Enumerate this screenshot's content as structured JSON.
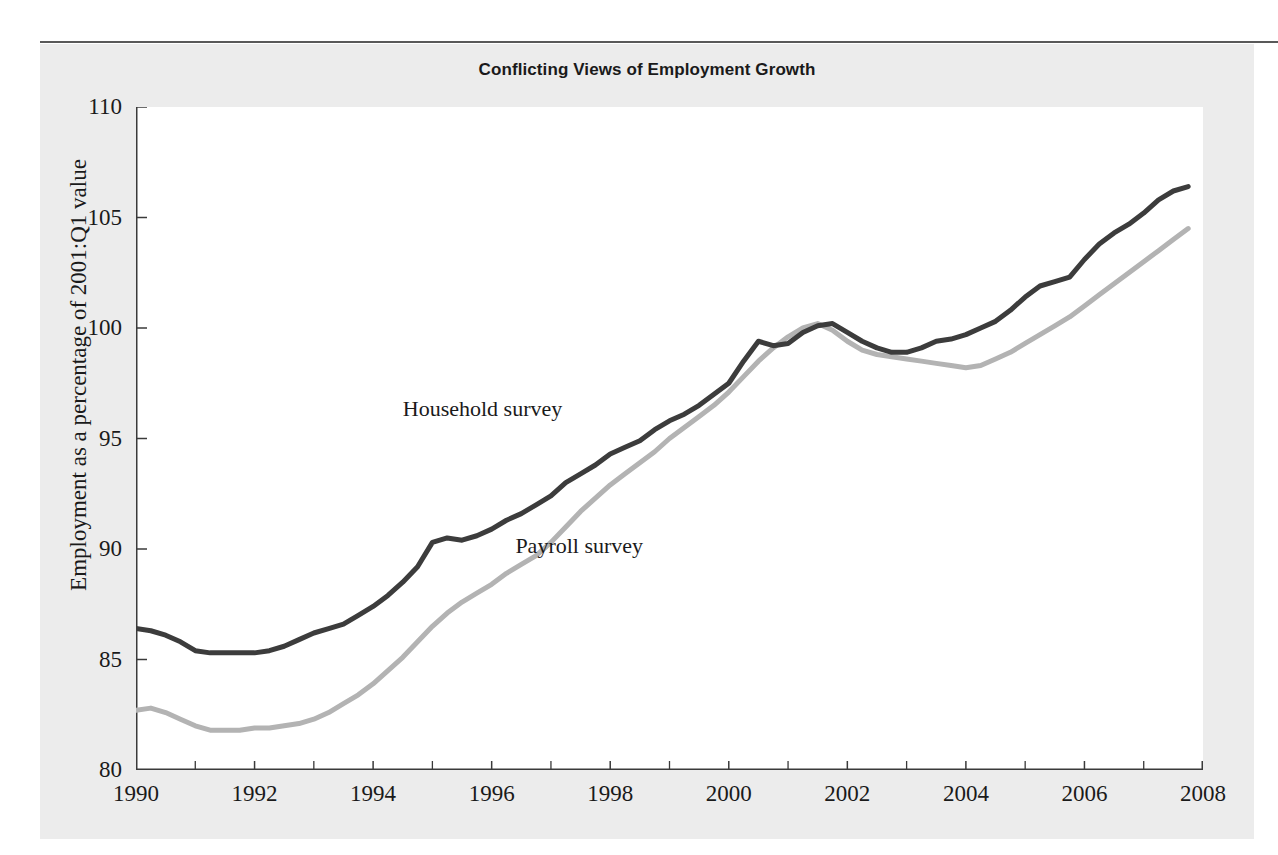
{
  "figure": {
    "title": "Conflicting Views of Employment Growth",
    "background_color": "#ececec",
    "plot_background_color": "#ffffff",
    "rule_color": "#595959"
  },
  "chart_data": {
    "type": "line",
    "title": "Conflicting Views of Employment Growth",
    "xlabel": "",
    "ylabel": "Employment as a percentage of 2001:Q1 value",
    "xlim": [
      1990,
      2008
    ],
    "ylim": [
      80,
      110
    ],
    "grid": false,
    "legend": "inline-annotations",
    "x_ticks": [
      "1990",
      "1992",
      "1994",
      "1996",
      "1998",
      "2000",
      "2002",
      "2004",
      "2006",
      "2008"
    ],
    "x_tick_values": [
      1990,
      1992,
      1994,
      1996,
      1998,
      2000,
      2002,
      2004,
      2006,
      2008
    ],
    "y_ticks": [
      "80",
      "85",
      "90",
      "95",
      "100",
      "105",
      "110"
    ],
    "y_tick_values": [
      80,
      85,
      90,
      95,
      100,
      105,
      110
    ],
    "x_minor_ticks": [
      1991,
      1993,
      1995,
      1997,
      1999,
      2001,
      2003,
      2005,
      2007
    ],
    "annotations": [
      {
        "text": "Household survey",
        "x": 1994.5,
        "y": 96.3
      },
      {
        "text": "Payroll survey",
        "x": 1996.4,
        "y": 90.1
      }
    ],
    "x": [
      1990.0,
      1990.25,
      1990.5,
      1990.75,
      1991.0,
      1991.25,
      1991.5,
      1991.75,
      1992.0,
      1992.25,
      1992.5,
      1992.75,
      1993.0,
      1993.25,
      1993.5,
      1993.75,
      1994.0,
      1994.25,
      1994.5,
      1994.75,
      1995.0,
      1995.25,
      1995.5,
      1995.75,
      1996.0,
      1996.25,
      1996.5,
      1996.75,
      1997.0,
      1997.25,
      1997.5,
      1997.75,
      1998.0,
      1998.25,
      1998.5,
      1998.75,
      1999.0,
      1999.25,
      1999.5,
      1999.75,
      2000.0,
      2000.25,
      2000.5,
      2000.75,
      2001.0,
      2001.25,
      2001.5,
      2001.75,
      2002.0,
      2002.25,
      2002.5,
      2002.75,
      2003.0,
      2003.25,
      2003.5,
      2003.75,
      2004.0,
      2004.25,
      2004.5,
      2004.75,
      2005.0,
      2005.25,
      2005.5,
      2005.75,
      2006.0,
      2006.25,
      2006.5,
      2006.75,
      2007.0,
      2007.25,
      2007.5,
      2007.75
    ],
    "series": [
      {
        "name": "Household survey",
        "color": "#3c3c3c",
        "values": [
          86.4,
          86.3,
          86.1,
          85.8,
          85.4,
          85.3,
          85.3,
          85.3,
          85.3,
          85.4,
          85.6,
          85.9,
          86.2,
          86.4,
          86.6,
          87.0,
          87.4,
          87.9,
          88.5,
          89.2,
          90.3,
          90.5,
          90.4,
          90.6,
          90.9,
          91.3,
          91.6,
          92.0,
          92.4,
          93.0,
          93.4,
          93.8,
          94.3,
          94.6,
          94.9,
          95.4,
          95.8,
          96.1,
          96.5,
          97.0,
          97.5,
          98.5,
          99.4,
          99.2,
          99.3,
          99.8,
          100.1,
          100.2,
          99.8,
          99.4,
          99.1,
          98.9,
          98.9,
          99.1,
          99.4,
          99.5,
          99.7,
          100.0,
          100.3,
          100.8,
          101.4,
          101.9,
          102.1,
          102.3,
          103.1,
          103.8,
          104.3,
          104.7,
          105.2,
          105.8,
          106.2,
          106.4
        ]
      },
      {
        "name": "Payroll survey",
        "color": "#b3b3b3",
        "values": [
          82.7,
          82.8,
          82.6,
          82.3,
          82.0,
          81.8,
          81.8,
          81.8,
          81.9,
          81.9,
          82.0,
          82.1,
          82.3,
          82.6,
          83.0,
          83.4,
          83.9,
          84.5,
          85.1,
          85.8,
          86.5,
          87.1,
          87.6,
          88.0,
          88.4,
          88.9,
          89.3,
          89.7,
          90.3,
          91.0,
          91.7,
          92.3,
          92.9,
          93.4,
          93.9,
          94.4,
          95.0,
          95.5,
          96.0,
          96.5,
          97.1,
          97.8,
          98.5,
          99.1,
          99.6,
          100.0,
          100.2,
          99.9,
          99.4,
          99.0,
          98.8,
          98.7,
          98.6,
          98.5,
          98.4,
          98.3,
          98.2,
          98.3,
          98.6,
          98.9,
          99.3,
          99.7,
          100.1,
          100.5,
          101.0,
          101.5,
          102.0,
          102.5,
          103.0,
          103.5,
          104.0,
          104.5
        ]
      }
    ]
  }
}
